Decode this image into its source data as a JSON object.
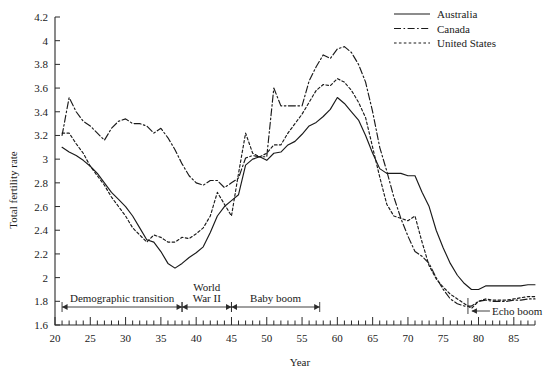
{
  "chart_data": {
    "type": "line",
    "title": "",
    "xlabel": "Year",
    "ylabel": "Total fertility rate",
    "xlim": [
      20,
      88
    ],
    "ylim": [
      1.6,
      4.2
    ],
    "xticks": [
      20,
      25,
      30,
      35,
      40,
      45,
      50,
      55,
      60,
      65,
      70,
      75,
      80,
      85
    ],
    "xtick_labels": [
      "20",
      "25",
      "30",
      "35",
      "40",
      "45",
      "50",
      "55",
      "60",
      "65",
      "70",
      "75",
      "80",
      "85"
    ],
    "xtick_minor_step": 1,
    "yticks": [
      1.6,
      1.8,
      2.0,
      2.2,
      2.4,
      2.6,
      2.8,
      3.0,
      3.2,
      3.4,
      3.6,
      3.8,
      4.0,
      4.2
    ],
    "ytick_labels": [
      "1.6",
      "1.8",
      "2",
      "2.2",
      "2.4",
      "2.6",
      "2.8",
      "3",
      "3.2",
      "3.4",
      "3.6",
      "3.8",
      "4",
      "4.2"
    ],
    "grid": false,
    "legend_position": "top-right",
    "series": [
      {
        "name": "Australia",
        "style": "solid",
        "color": "#1a1a1a",
        "x": [
          21,
          22,
          23,
          24,
          25,
          26,
          27,
          28,
          29,
          30,
          31,
          32,
          33,
          34,
          35,
          36,
          37,
          38,
          39,
          40,
          41,
          42,
          43,
          44,
          45,
          46,
          47,
          48,
          49,
          50,
          51,
          52,
          53,
          54,
          55,
          56,
          57,
          58,
          59,
          60,
          61,
          62,
          63,
          64,
          65,
          66,
          67,
          68,
          69,
          70,
          71,
          72,
          73,
          74,
          75,
          76,
          77,
          78,
          79,
          80,
          81,
          82,
          83,
          84,
          85,
          86,
          87,
          88
        ],
        "values": [
          3.1,
          3.06,
          3.03,
          2.99,
          2.94,
          2.88,
          2.8,
          2.72,
          2.66,
          2.6,
          2.52,
          2.42,
          2.32,
          2.3,
          2.22,
          2.12,
          2.08,
          2.12,
          2.17,
          2.21,
          2.26,
          2.38,
          2.52,
          2.6,
          2.65,
          2.7,
          2.95,
          3.0,
          3.02,
          2.99,
          3.05,
          3.06,
          3.12,
          3.15,
          3.21,
          3.28,
          3.31,
          3.36,
          3.42,
          3.52,
          3.47,
          3.4,
          3.33,
          3.2,
          3.05,
          2.92,
          2.88,
          2.88,
          2.88,
          2.86,
          2.86,
          2.72,
          2.6,
          2.4,
          2.25,
          2.12,
          2.02,
          1.95,
          1.9,
          1.9,
          1.93,
          1.93,
          1.93,
          1.93,
          1.93,
          1.93,
          1.94,
          1.94
        ]
      },
      {
        "name": "Canada",
        "style": "dashdot",
        "color": "#1a1a1a",
        "x": [
          21,
          22,
          23,
          24,
          25,
          26,
          27,
          28,
          29,
          30,
          31,
          32,
          33,
          34,
          35,
          36,
          37,
          38,
          39,
          40,
          41,
          42,
          43,
          44,
          45,
          46,
          47,
          48,
          49,
          50,
          51,
          52,
          53,
          54,
          55,
          56,
          57,
          58,
          59,
          60,
          61,
          62,
          63,
          64,
          65,
          66,
          67,
          68,
          69,
          70,
          71,
          72,
          73,
          74,
          75,
          76,
          77,
          78,
          79,
          80,
          81,
          82,
          83,
          84,
          85,
          86,
          87,
          88
        ],
        "values": [
          3.2,
          3.52,
          3.4,
          3.32,
          3.28,
          3.22,
          3.16,
          3.26,
          3.32,
          3.34,
          3.3,
          3.3,
          3.28,
          3.22,
          3.26,
          3.18,
          3.08,
          2.96,
          2.86,
          2.8,
          2.78,
          2.82,
          2.82,
          2.76,
          2.8,
          2.84,
          3.01,
          3.03,
          3.02,
          3.02,
          3.6,
          3.45,
          3.45,
          3.45,
          3.45,
          3.66,
          3.78,
          3.88,
          3.85,
          3.93,
          3.95,
          3.9,
          3.8,
          3.65,
          3.4,
          3.1,
          2.9,
          2.68,
          2.5,
          2.35,
          2.22,
          2.18,
          2.12,
          2.0,
          1.9,
          1.82,
          1.78,
          1.76,
          1.76,
          1.8,
          1.81,
          1.8,
          1.8,
          1.8,
          1.81,
          1.81,
          1.82,
          1.82
        ]
      },
      {
        "name": "United States",
        "style": "dotted",
        "color": "#1a1a1a",
        "x": [
          21,
          22,
          23,
          24,
          25,
          26,
          27,
          28,
          29,
          30,
          31,
          32,
          33,
          34,
          35,
          36,
          37,
          38,
          39,
          40,
          41,
          42,
          43,
          44,
          45,
          46,
          47,
          48,
          49,
          50,
          51,
          52,
          53,
          54,
          55,
          56,
          57,
          58,
          59,
          60,
          61,
          62,
          63,
          64,
          65,
          66,
          67,
          68,
          69,
          70,
          71,
          72,
          73,
          74,
          75,
          76,
          77,
          78,
          79,
          80,
          81,
          82,
          83,
          84,
          85,
          86,
          87,
          88
        ],
        "values": [
          3.22,
          3.22,
          3.13,
          3.05,
          2.94,
          2.86,
          2.78,
          2.68,
          2.6,
          2.52,
          2.42,
          2.36,
          2.3,
          2.36,
          2.34,
          2.3,
          2.3,
          2.34,
          2.33,
          2.37,
          2.42,
          2.52,
          2.72,
          2.62,
          2.52,
          2.88,
          3.22,
          3.05,
          3.02,
          3.05,
          3.12,
          3.12,
          3.22,
          3.3,
          3.38,
          3.48,
          3.58,
          3.63,
          3.62,
          3.68,
          3.65,
          3.58,
          3.48,
          3.35,
          3.1,
          2.85,
          2.62,
          2.52,
          2.5,
          2.48,
          2.52,
          2.3,
          2.1,
          1.99,
          1.92,
          1.86,
          1.82,
          1.78,
          1.74,
          1.8,
          1.82,
          1.81,
          1.81,
          1.81,
          1.82,
          1.83,
          1.84,
          1.84
        ]
      }
    ],
    "annotations": [
      {
        "label": "Demographic transition",
        "start": 21,
        "end": 38,
        "multiline": false
      },
      {
        "label": "World War II",
        "start": 38,
        "end": 45,
        "multiline": true,
        "line1": "World",
        "line2": "War II"
      },
      {
        "label": "Baby boom",
        "start": 45,
        "end": 57.5,
        "multiline": false
      },
      {
        "label": "Echo boom",
        "start": 78.5,
        "end": 78.5,
        "multiline": false,
        "pointer": true
      }
    ]
  },
  "legend": {
    "items": [
      {
        "label": "Australia",
        "style": "solid"
      },
      {
        "label": "Canada",
        "style": "dashdot"
      },
      {
        "label": "United States",
        "style": "dotted"
      }
    ]
  }
}
